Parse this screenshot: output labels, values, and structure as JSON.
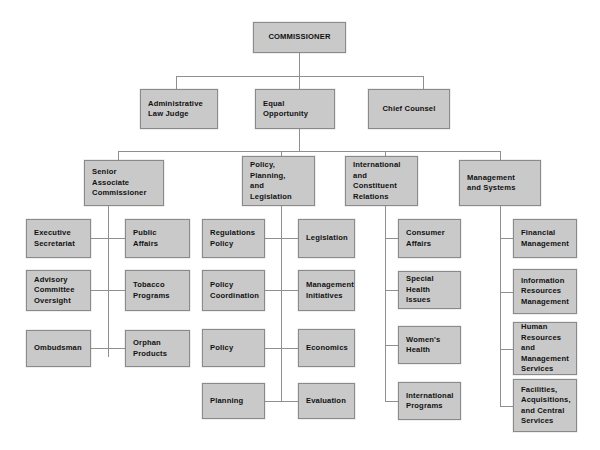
{
  "diagram": {
    "colors": {
      "box_fill": "#c9c9c9",
      "box_border": "#8a8a8a",
      "connector": "#8f8f8f",
      "background": "#ffffff",
      "text": "#111111"
    }
  },
  "tier1": {
    "commissioner": "COMMISSIONER"
  },
  "tier2": [
    {
      "label": "Administrative\nLaw Judge"
    },
    {
      "label": "Equal\nOpportunity"
    },
    {
      "label": "Chief Counsel"
    }
  ],
  "tier3": [
    {
      "label": "Senior\nAssociate\nCommissioner"
    },
    {
      "label": "Policy,\nPlanning,\nand\nLegislation"
    },
    {
      "label": "International\nand\nConstituent\nRelations"
    },
    {
      "label": "Management\nand Systems"
    }
  ],
  "groups": {
    "senior_associate_commissioner": {
      "left": [
        {
          "label": "Executive\nSecretariat"
        },
        {
          "label": "Advisory\nCommittee\nOversight"
        },
        {
          "label": "Ombudsman"
        }
      ],
      "right": [
        {
          "label": "Public\nAffairs"
        },
        {
          "label": "Tobacco\nPrograms"
        },
        {
          "label": "Orphan\nProducts"
        }
      ]
    },
    "policy_planning_and_legislation": {
      "left": [
        {
          "label": "Regulations\nPolicy"
        },
        {
          "label": "Policy\nCoordination"
        },
        {
          "label": "Policy"
        },
        {
          "label": "Planning"
        }
      ],
      "right": [
        {
          "label": "Legislation"
        },
        {
          "label": "Management\nInitiatives"
        },
        {
          "label": "Economics"
        },
        {
          "label": "Evaluation"
        }
      ]
    },
    "international_and_constituent_relations": {
      "right": [
        {
          "label": "Consumer\nAffairs"
        },
        {
          "label": "Special Health\nIssues"
        },
        {
          "label": "Women's\nHealth"
        },
        {
          "label": "International\nPrograms"
        }
      ]
    },
    "management_and_systems": {
      "right": [
        {
          "label": "Financial\nManagement"
        },
        {
          "label": "Information\nResources\nManagement"
        },
        {
          "label": "Human\nResources and\nManagement\nServices"
        },
        {
          "label": "Facilities,\nAcquisitions,\nand Central\nServices"
        }
      ]
    }
  }
}
